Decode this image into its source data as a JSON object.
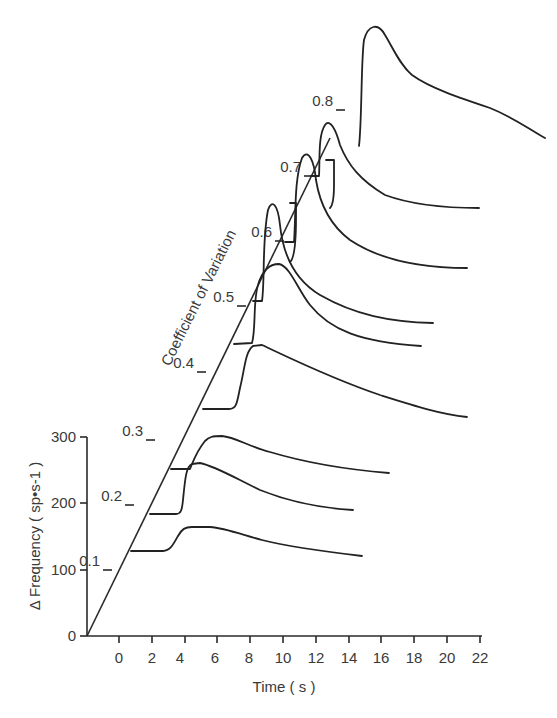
{
  "chart_data": {
    "type": "line",
    "subtype": "3d-waterfall",
    "title": "",
    "xlabel": "Time ( s )",
    "ylabel": "Δ Frequency ( sp•s-1 )",
    "zlabel": "Coefficient of Variation",
    "x_ticks": [
      "0",
      "2",
      "4",
      "6",
      "8",
      "10",
      "12",
      "14",
      "16",
      "18",
      "20",
      "22"
    ],
    "y_ticks": [
      "0",
      "100",
      "200",
      "300"
    ],
    "z_ticks": [
      "0.1",
      "0.2",
      "0.3",
      "0.4",
      "0.5",
      "0.6",
      "0.7",
      "0.8"
    ],
    "xlim": [
      -2,
      22
    ],
    "ylim": [
      0,
      300
    ],
    "grid": false,
    "legend": "none",
    "series": [
      {
        "name": "0.1",
        "approx": "flat baseline, rise at ~3 s to ~+40 sp/s, slow decay to ~15 s"
      },
      {
        "name": "0.2",
        "approx": "flat baseline, sharp rise at ~3.5 s to ~+80 sp/s, decay to ~14 s"
      },
      {
        "name": "0.3",
        "approx": "rise at ~5 s to ~+55 sp/s, decay to ~16.5 s"
      },
      {
        "name": "0.4",
        "approx": "rise at ~6 s to ~+100 sp/s, decay to ~21 s"
      },
      {
        "name": "0.5",
        "approx": "rise at ~8 s to ~+120 sp/s, decay to ~18 s"
      },
      {
        "name": "0.6",
        "approx": "sharp peak at ~10 s, decay to ~19 s"
      },
      {
        "name": "0.7",
        "approx": "sharp peak at ~12 s, decay to ~21 s"
      },
      {
        "name": "0.8",
        "approx": "very large peak at ~15.5 s, decay to ~22 s"
      }
    ]
  },
  "axes": {
    "y_axis_label": "Δ Frequency ( sp•s-1 )",
    "x_axis_label": "Time ( s )",
    "z_axis_label": "Coefficient of Variation"
  },
  "traces": [
    {
      "label": "0.1",
      "d": "M131,551 L163,551 C170,551 173,545 178,536 C182,529 185,527 192,527 L210,527 C225,528 240,534 262,540 C290,547 320,551 362,556"
    },
    {
      "label": "0.2",
      "d": "M150,514 L176,514 C181,514 182,510 183,500 C185,480 186,466 192,464 L200,463 C215,466 235,478 260,490 C290,502 320,508 353,510"
    },
    {
      "label": "0.3",
      "d": "M171,469 L190,469 C193,462 196,452 205,441 C209,437 212,436 222,436 C235,437 250,447 270,452 C300,461 340,469 389,473"
    },
    {
      "label": "0.4",
      "d": "M203,409 L229,409 C237,409 237,402 240,388 C245,368 245,352 253,346 L262,345 C290,358 330,378 380,395 C415,406 440,414 467,417"
    },
    {
      "label": "0.5",
      "d": "M234,344 L252,343 C256,330 253,300 258,285 C263,268 272,264 279,264 C290,266 298,290 310,305 C330,330 360,342 421,346"
    },
    {
      "label": "0.6",
      "d": "M253,301 L262,301 C265,280 262,240 268,210 C272,198 278,205 280,225 C283,255 295,280 320,295 C355,315 390,322 433,323"
    },
    {
      "label": "0.7",
      "d": "M285,242 L294,242 C296,215 294,180 302,158 C308,148 314,160 316,180 C320,205 330,225 350,240 C380,260 420,268 467,268"
    },
    {
      "label": "0.8",
      "d": "M311,176 L319,176 C320,160 318,135 325,125 C330,118 336,130 340,145 C348,165 360,180 385,195 C415,206 450,208 479,208"
    },
    {
      "label": "0.8-peak",
      "d": "M359,146 C362,120 361,60 364,40 C368,25 378,22 385,35 C393,48 400,65 412,75 C430,88 460,98 490,108 C515,118 530,130 545,138"
    }
  ],
  "connectors": [
    {
      "d": "M290,203 L296,203 L296,218 C296,240 295,258 290,262"
    },
    {
      "d": "M326,160 L334,160 L334,185 C334,195 333,205 330,208"
    }
  ],
  "z_axis_ticks": [
    {
      "label": "0.1",
      "x": 91,
      "y": 551,
      "tx": 112,
      "ty": 570
    },
    {
      "label": "0.2",
      "x": 110,
      "y": 506,
      "tx": 134,
      "ty": 505
    },
    {
      "label": "0.3",
      "x": 132,
      "y": 441,
      "tx": 155,
      "ty": 440
    },
    {
      "label": "0.4",
      "x": 173,
      "y": 376,
      "tx": 206,
      "ty": 372
    },
    {
      "label": "0.5",
      "x": 210,
      "y": 304,
      "tx": 246,
      "ty": 306
    },
    {
      "label": "0.6",
      "x": 244,
      "y": 240,
      "tx": 284,
      "ty": 241
    },
    {
      "label": "0.7",
      "x": 276,
      "y": 175,
      "tx": 313,
      "ty": 176
    },
    {
      "label": "0.8",
      "x": 311,
      "y": 107,
      "tx": 345,
      "ty": 110
    }
  ]
}
